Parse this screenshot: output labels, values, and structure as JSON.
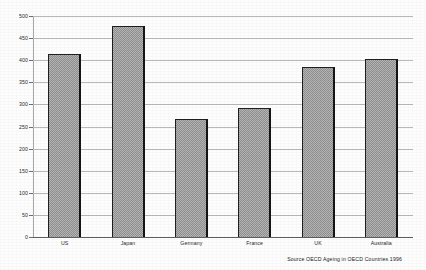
{
  "chart_data": {
    "type": "bar",
    "title": "",
    "subtitle": "",
    "xlabel": "",
    "ylabel": "",
    "categories": [
      "US",
      "Japan",
      "Germany",
      "France",
      "UK",
      "Australia"
    ],
    "values": [
      415,
      478,
      267,
      293,
      385,
      402
    ],
    "ylim": [
      0,
      500
    ],
    "ytick_step": 50,
    "yticks": [
      0,
      50,
      100,
      150,
      200,
      250,
      300,
      350,
      400,
      450,
      500
    ],
    "ytick_labels": [
      "0",
      "50",
      "100",
      "150",
      "200",
      "250",
      "300",
      "350",
      "400",
      "450",
      "500"
    ],
    "grid": true,
    "grid_axis": "y",
    "legend": false,
    "legend_position": "none",
    "bar_fill_color": "#9d9d9d",
    "bar_edge_color": "#1f1f1f",
    "gridline_color": "#b9b9b9",
    "axis_color": "#5d5d5d",
    "background_color": "#fdfdfd",
    "annotations": []
  },
  "source": {
    "text": "Source  OECD Ageing in OECD Countries 1996"
  }
}
